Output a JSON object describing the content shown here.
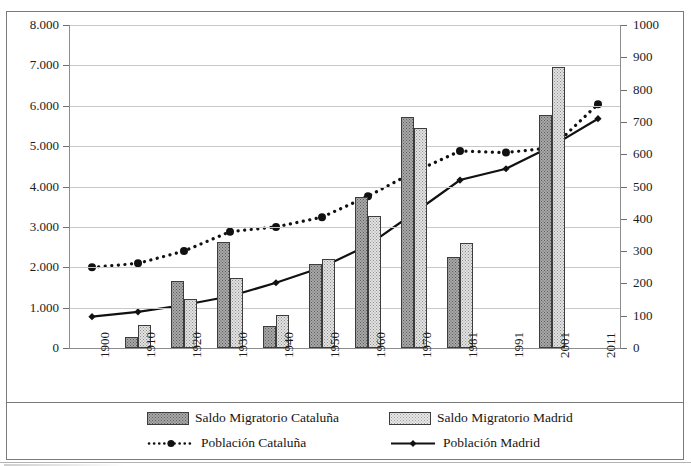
{
  "title": {
    "partial_text": "",
    "note_visible": "title row is cropped at top edge"
  },
  "axes": {
    "left": {
      "labels": [
        "8.000",
        "7.000",
        "6.000",
        "5.000",
        "4.000",
        "3.000",
        "2.000",
        "1.000",
        "0"
      ],
      "min": 0,
      "max": 8000,
      "step": 1000
    },
    "right": {
      "labels": [
        "1000",
        "900",
        "800",
        "700",
        "600",
        "500",
        "400",
        "300",
        "200",
        "100",
        "0"
      ],
      "min": 0,
      "max": 1000,
      "step": 100
    },
    "x": {
      "labels": [
        "1900",
        "1910",
        "1920",
        "1930",
        "1940",
        "1950",
        "1960",
        "1970",
        "1981",
        "1991",
        "2001",
        "2011"
      ]
    }
  },
  "legend": {
    "items": [
      {
        "label": "Saldo Migratorio Cataluña",
        "kind": "bar-dark"
      },
      {
        "label": "Saldo Migratorio Madrid",
        "kind": "bar-light"
      },
      {
        "label": "Población Cataluña",
        "kind": "line-dotted"
      },
      {
        "label": "Población Madrid",
        "kind": "line-solid"
      }
    ]
  },
  "colors": {
    "bar_cataluna": "#a8a8a8",
    "bar_madrid": "#e3e3e3",
    "bar_border": "#3d3d3d",
    "line": "#111111",
    "grid": "#c8c8c8",
    "frame": "#7a7a7a"
  },
  "chart_data": {
    "type": "bar",
    "title": "",
    "xlabel": "",
    "ylabel": "",
    "ylim": [
      0,
      8000
    ],
    "y2lim": [
      0,
      1000
    ],
    "grid": true,
    "legend_position": "bottom",
    "categories": [
      "1900",
      "1910",
      "1920",
      "1930",
      "1940",
      "1950",
      "1960",
      "1970",
      "1981",
      "1991",
      "2001",
      "2011"
    ],
    "series": [
      {
        "name": "Saldo Migratorio Cataluña",
        "type": "bar",
        "axis": "left",
        "values": [
          null,
          270,
          1670,
          2630,
          550,
          2070,
          3740,
          5730,
          2250,
          null,
          5780,
          null
        ]
      },
      {
        "name": "Saldo Migratorio Madrid",
        "type": "bar",
        "axis": "left",
        "values": [
          null,
          570,
          1210,
          1740,
          830,
          2200,
          3280,
          5450,
          2600,
          null,
          6970,
          null
        ]
      },
      {
        "name": "Población Cataluña",
        "type": "line-dotted",
        "axis": "right",
        "values": [
          250,
          262,
          300,
          360,
          375,
          405,
          470,
          545,
          610,
          605,
          620,
          755
        ]
      },
      {
        "name": "Población Madrid",
        "type": "line-solid",
        "axis": "right",
        "values": [
          97,
          112,
          133,
          160,
          202,
          250,
          318,
          418,
          520,
          555,
          625,
          710
        ]
      }
    ]
  }
}
